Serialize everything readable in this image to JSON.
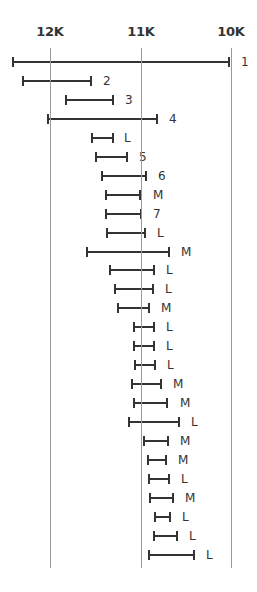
{
  "chart_data": {
    "type": "range",
    "title": "",
    "xlabel": "",
    "ylabel": "",
    "axis": {
      "direction": "reversed",
      "ticks": [
        {
          "label": "12K",
          "value": 12000
        },
        {
          "label": "11K",
          "value": 11000
        },
        {
          "label": "10K",
          "value": 10000
        }
      ],
      "xlim": [
        12420,
        9770
      ],
      "grid": true
    },
    "series": [
      {
        "label": "1",
        "low": 10020,
        "high": 12410
      },
      {
        "label": "2",
        "low": 11550,
        "high": 12300
      },
      {
        "label": "3",
        "low": 11300,
        "high": 11820
      },
      {
        "label": "4",
        "low": 10820,
        "high": 12020
      },
      {
        "label": "L",
        "low": 11310,
        "high": 11540
      },
      {
        "label": "5",
        "low": 11150,
        "high": 11490
      },
      {
        "label": "6",
        "low": 10940,
        "high": 11430
      },
      {
        "label": "M",
        "low": 11000,
        "high": 11380
      },
      {
        "label": "7",
        "low": 10990,
        "high": 11380
      },
      {
        "label": "L",
        "low": 10950,
        "high": 11370
      },
      {
        "label": "M",
        "low": 10680,
        "high": 11590
      },
      {
        "label": "L",
        "low": 10850,
        "high": 11340
      },
      {
        "label": "L",
        "low": 10860,
        "high": 11280
      },
      {
        "label": "M",
        "low": 10910,
        "high": 11250
      },
      {
        "label": "L",
        "low": 10850,
        "high": 11070
      },
      {
        "label": "L",
        "low": 10850,
        "high": 11070
      },
      {
        "label": "L",
        "low": 10840,
        "high": 11060
      },
      {
        "label": "M",
        "low": 10770,
        "high": 11090
      },
      {
        "label": "M",
        "low": 10700,
        "high": 11070
      },
      {
        "label": "L",
        "low": 10580,
        "high": 11130
      },
      {
        "label": "M",
        "low": 10700,
        "high": 10960
      },
      {
        "label": "M",
        "low": 10720,
        "high": 10920
      },
      {
        "label": "L",
        "low": 10690,
        "high": 10910
      },
      {
        "label": "M",
        "low": 10640,
        "high": 10890
      },
      {
        "label": "L",
        "low": 10670,
        "high": 10840
      },
      {
        "label": "L",
        "low": 10600,
        "high": 10850
      },
      {
        "label": "L",
        "low": 10410,
        "high": 10910
      }
    ]
  }
}
